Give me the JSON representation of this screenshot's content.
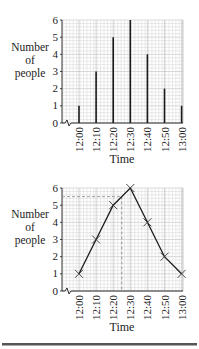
{
  "chart_data": [
    {
      "type": "bar",
      "title": "",
      "xlabel": "Time",
      "ylabel": "Number of people",
      "ylabel_lines": [
        "Number",
        "of",
        "people"
      ],
      "categories": [
        "12:00",
        "12:10",
        "12:20",
        "12:30",
        "12:40",
        "12:50",
        "13:00"
      ],
      "values": [
        1,
        3,
        5,
        6,
        4,
        2,
        1
      ],
      "yticks": [
        "0",
        "1",
        "2",
        "3",
        "4",
        "5",
        "6"
      ],
      "ylim": [
        0,
        6
      ],
      "grid": true,
      "axis_break": true,
      "style": "vertical line graph"
    },
    {
      "type": "line",
      "title": "",
      "xlabel": "Time",
      "ylabel": "Number of people",
      "ylabel_lines": [
        "Number",
        "of",
        "people"
      ],
      "categories": [
        "12:00",
        "12:10",
        "12:20",
        "12:30",
        "12:40",
        "12:50",
        "13:00"
      ],
      "values": [
        1,
        3,
        5,
        6,
        4,
        2,
        1
      ],
      "yticks": [
        "0",
        "1",
        "2",
        "3",
        "4",
        "5",
        "6"
      ],
      "ylim": [
        0,
        6
      ],
      "grid": true,
      "axis_break": true,
      "marker": "x",
      "annotations": [
        {
          "type": "dashed-horizontal",
          "y": 5.5
        },
        {
          "type": "dashed-vertical",
          "x": "12:25"
        }
      ]
    }
  ],
  "colors": {
    "grid_minor": "#d4d4d4",
    "grid_major": "#b0b0b0",
    "line": "#1a1a1a",
    "dashed": "#9a9a9a",
    "rule": "#555555"
  }
}
